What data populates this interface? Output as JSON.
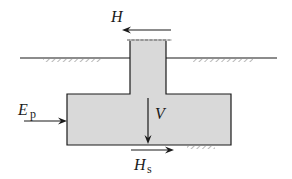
{
  "diagram": {
    "type": "free-body diagram of spread footing with column",
    "colors": {
      "line": "#1a1a1a",
      "concrete_fill": "#d9d9d9",
      "hatch": "#8a8a8a",
      "background": "#ffffff"
    },
    "labels": {
      "H": {
        "main": "H",
        "sub": ""
      },
      "Ep": {
        "main": "E",
        "sub": "p"
      },
      "V": {
        "main": "V",
        "sub": ""
      },
      "Hs": {
        "main": "H",
        "sub": "s"
      }
    },
    "forces": [
      {
        "id": "H",
        "direction": "left",
        "description": "horizontal load at column top"
      },
      {
        "id": "Ep",
        "direction": "right",
        "description": "passive earth pressure on footing side"
      },
      {
        "id": "V",
        "direction": "down",
        "description": "vertical load"
      },
      {
        "id": "Hs",
        "direction": "right",
        "description": "base shear resistance"
      }
    ]
  }
}
